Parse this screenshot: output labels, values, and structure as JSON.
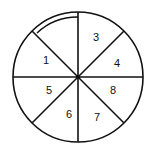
{
  "diagram": {
    "type": "spinner-wheel",
    "sectors": 8,
    "center": {
      "x": 78,
      "y": 77
    },
    "radius": 65,
    "labels": [
      {
        "id": "3",
        "text": "3",
        "x": 93,
        "y": 41
      },
      {
        "id": "4",
        "text": "4",
        "x": 114,
        "y": 67
      },
      {
        "id": "1",
        "text": "1",
        "x": 43,
        "y": 64
      },
      {
        "id": "5",
        "text": "5",
        "x": 46,
        "y": 94
      },
      {
        "id": "8",
        "text": "8",
        "x": 110,
        "y": 94
      },
      {
        "id": "6",
        "text": "6",
        "x": 66,
        "y": 118
      },
      {
        "id": "7",
        "text": "7",
        "x": 94,
        "y": 121
      }
    ],
    "highlighted_sector": "top-left (unlabeled, double arc)",
    "stroke_color": "#111111"
  }
}
